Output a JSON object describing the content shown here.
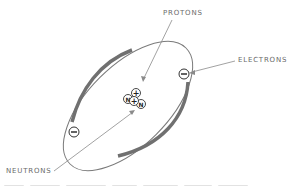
{
  "diagram": {
    "labels": {
      "protons": "PROTONS",
      "electrons": "ELECTRONS",
      "neutrons": "NEUTRONS"
    },
    "nucleus": {
      "particles": [
        {
          "type": "proton",
          "symbol": "+"
        },
        {
          "type": "proton",
          "symbol": "+"
        },
        {
          "type": "neutron",
          "symbol": "N"
        },
        {
          "type": "neutron",
          "symbol": "N"
        }
      ]
    },
    "electrons": [
      {
        "symbol": "−"
      },
      {
        "symbol": "−"
      }
    ],
    "colors": {
      "orbit": "#707070",
      "line": "#8a8a8a",
      "text": "#6a6a6a"
    }
  }
}
